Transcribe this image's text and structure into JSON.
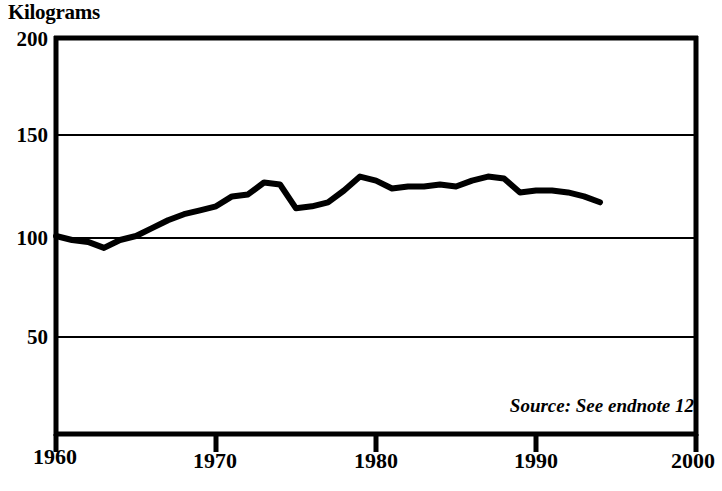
{
  "chart_data": {
    "type": "line",
    "title": "",
    "ylabel": "Kilograms",
    "xlabel": "",
    "ylim": [
      0,
      200
    ],
    "xlim": [
      1960,
      2000
    ],
    "yticks": [
      200,
      150,
      100,
      50
    ],
    "xticks": [
      1960,
      1970,
      1980,
      1990,
      2000
    ],
    "grid": true,
    "grid_axis": "y",
    "legend": false,
    "annotation": "Source: See endnote 12",
    "line_color": "#000000",
    "line_width": 6,
    "series": [
      {
        "name": "World grain production per person",
        "x": [
          1960,
          1961,
          1962,
          1963,
          1964,
          1965,
          1966,
          1967,
          1968,
          1969,
          1970,
          1971,
          1972,
          1973,
          1974,
          1975,
          1976,
          1977,
          1978,
          1979,
          1980,
          1981,
          1982,
          1983,
          1984,
          1985,
          1986,
          1987,
          1988,
          1989,
          1990,
          1991,
          1992,
          1993,
          1994
        ],
        "values": [
          100,
          98,
          97,
          94,
          98,
          100,
          104,
          108,
          111,
          113,
          115,
          120,
          121,
          127,
          126,
          114,
          115,
          117,
          123,
          130,
          128,
          124,
          125,
          125,
          126,
          125,
          128,
          130,
          129,
          122,
          123,
          123,
          122,
          120,
          117
        ]
      }
    ]
  },
  "axis_title": "Kilograms",
  "ytick_labels": [
    "200",
    "150",
    "100",
    "50"
  ],
  "xtick_labels": [
    "1960",
    "1970",
    "1980",
    "1990",
    "2000"
  ],
  "source": "Source: See endnote 12"
}
